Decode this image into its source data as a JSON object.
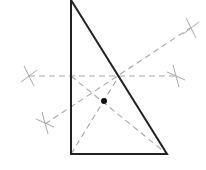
{
  "diagram": {
    "kind": "right-triangle-perpendicular-bisector-construction",
    "colors": {
      "background": "#ffffff",
      "triangle_stroke": "#222222",
      "construction_stroke": "#a8a8a8",
      "point_fill": "#111111"
    },
    "triangle": {
      "vertices": {
        "top": [
          71,
          0
        ],
        "bottom_left": [
          71,
          154
        ],
        "bottom_right": [
          167,
          154
        ]
      }
    },
    "construction_lines": [
      {
        "name": "horizontal-bisector",
        "from": [
          29,
          76
        ],
        "to": [
          177,
          76
        ]
      },
      {
        "name": "diagonal-bisector",
        "from": [
          45,
          124
        ],
        "to": [
          190,
          28
        ]
      },
      {
        "name": "median-from-bottom-left",
        "from": [
          71,
          154
        ],
        "to": [
          119,
          76
        ]
      },
      {
        "name": "line-to-bottom-right",
        "from": [
          71,
          76
        ],
        "to": [
          167,
          154
        ]
      }
    ],
    "arc_marks": [
      {
        "name": "arc-mark-left",
        "center": [
          29,
          76
        ]
      },
      {
        "name": "arc-mark-right",
        "center": [
          176,
          76
        ]
      },
      {
        "name": "arc-mark-top-right",
        "center": [
          191,
          28
        ]
      },
      {
        "name": "arc-mark-bottom-left",
        "center": [
          45,
          123
        ]
      }
    ],
    "point": {
      "name": "centroid-point",
      "center": [
        104,
        101
      ],
      "radius": 3
    }
  }
}
